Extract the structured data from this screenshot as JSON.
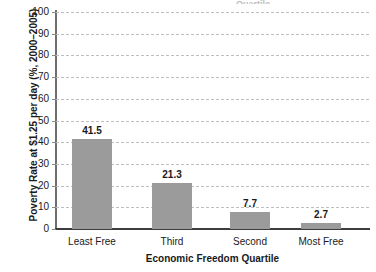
{
  "chart_data": {
    "type": "bar",
    "title": "",
    "categories": [
      "Least Free",
      "Third",
      "Second",
      "Most Free"
    ],
    "values": [
      41.5,
      21.3,
      7.7,
      2.7
    ],
    "value_labels": [
      "41.5",
      "21.3",
      "7.7",
      "2.7"
    ],
    "xlabel": "Economic Freedom Quartile",
    "ylabel": "Poverty Rate at $1.25 per day (%, 2000–2005)",
    "ylim": [
      0,
      100
    ],
    "ytick_labels": [
      "100",
      "90",
      "80",
      "70",
      "60",
      "50",
      "40",
      "30",
      "20",
      "10",
      "0"
    ],
    "ytick_values": [
      100,
      90,
      80,
      70,
      60,
      50,
      40,
      30,
      20,
      10,
      0
    ],
    "grid": "horizontal-dashed",
    "legend": "none",
    "bar_color": "#9b9b9b",
    "grid_color": "#bfbfbf",
    "axis_color": "#3d3d3d",
    "text_color": "#1a1a1a"
  },
  "cut_title": "Quartile"
}
